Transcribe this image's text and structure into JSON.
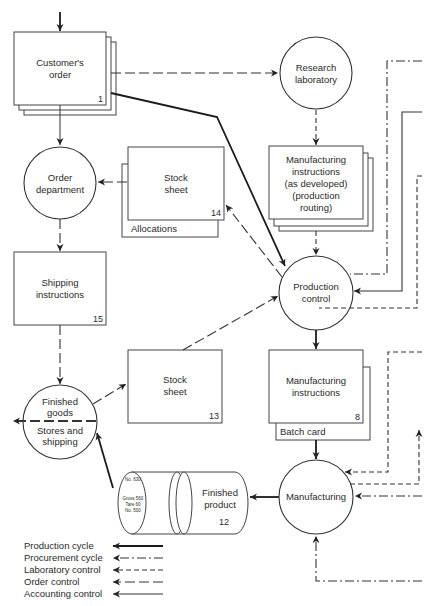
{
  "diagram": {
    "nodes": {
      "customers_order": {
        "label_1": "Customer's",
        "label_2": "order",
        "number": "1",
        "shape": "document-stack"
      },
      "research_laboratory": {
        "label_1": "Research",
        "label_2": "laboratory",
        "shape": "circle"
      },
      "order_department": {
        "label_1": "Order",
        "label_2": "department",
        "shape": "circle"
      },
      "stock_sheet_14": {
        "label_1": "Stock",
        "label_2": "sheet",
        "number": "14",
        "sublabel": "Allocations",
        "shape": "document"
      },
      "manufacturing_instructions_dev": {
        "label_1": "Manufacturing",
        "label_2": "instructions",
        "label_3": "(as developed)",
        "label_4": "(production",
        "label_5": "routing)",
        "shape": "document-stack"
      },
      "shipping_instructions": {
        "label_1": "Shipping",
        "label_2": "instructions",
        "number": "15",
        "shape": "document"
      },
      "production_control": {
        "label_1": "Production",
        "label_2": "control",
        "shape": "circle"
      },
      "finished_goods": {
        "label_1": "Finished",
        "label_2": "goods",
        "label_3": "Stores and",
        "label_4": "shipping",
        "shape": "split-circle"
      },
      "stock_sheet_13": {
        "label_1": "Stock",
        "label_2": "sheet",
        "number": "13",
        "shape": "document"
      },
      "manufacturing_instructions": {
        "label_1": "Manufacturing",
        "label_2": "instructions",
        "number": "8",
        "sublabel": "Batch card",
        "shape": "document"
      },
      "finished_product": {
        "label_1": "Finished",
        "label_2": "product",
        "number": "12",
        "tag_1": "No. 630",
        "tag_2": "Gross 560",
        "tag_3": "Tare 60",
        "tag_4": "No. 500",
        "shape": "drum"
      },
      "manufacturing": {
        "label": "Manufacturing",
        "shape": "circle"
      }
    },
    "legend": [
      {
        "label": "Production cycle",
        "style": "solid-heavy"
      },
      {
        "label": "Procurement cycle",
        "style": "dash-dot"
      },
      {
        "label": "Laboratory control",
        "style": "short-dash"
      },
      {
        "label": "Order control",
        "style": "long-dash"
      },
      {
        "label": "Accounting control",
        "style": "solid"
      }
    ]
  }
}
